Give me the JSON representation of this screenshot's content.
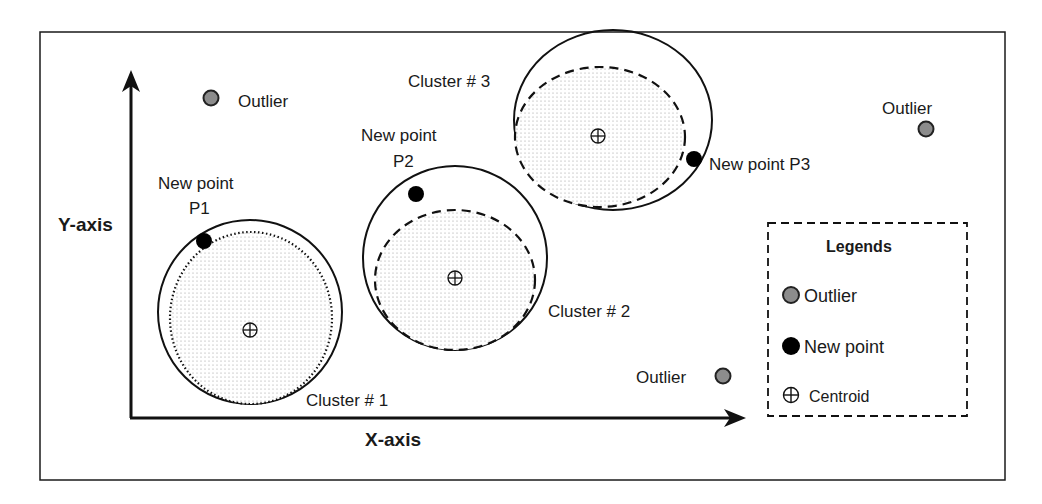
{
  "diagram": {
    "title": "",
    "axes": {
      "x_label": "X-axis",
      "y_label": "Y-axis"
    },
    "clusters": [
      {
        "label": "Cluster # 1",
        "boundary_style": "dotted"
      },
      {
        "label": "Cluster # 2",
        "boundary_style": "dashed"
      },
      {
        "label": "Cluster # 3",
        "boundary_style": "dashed"
      }
    ],
    "new_points": [
      {
        "label_line1": "New point",
        "label_line2": "P1"
      },
      {
        "label_line1": "New point",
        "label_line2": "P2"
      },
      {
        "label": "New point P3"
      }
    ],
    "outliers": [
      {
        "label": "Outlier"
      },
      {
        "label": "Outlier"
      },
      {
        "label": "Outlier"
      }
    ],
    "legend": {
      "title": "Legends",
      "items": [
        {
          "icon": "outlier-dot-icon",
          "label": "Outlier"
        },
        {
          "icon": "new-point-dot-icon",
          "label": "New point"
        },
        {
          "icon": "centroid-icon",
          "label": "Centroid"
        }
      ]
    },
    "colors": {
      "outlier_fill": "#8c8c8c",
      "new_point_fill": "#000000",
      "stroke": "#1a1a1a",
      "stipple": "#9a9a9a"
    }
  }
}
